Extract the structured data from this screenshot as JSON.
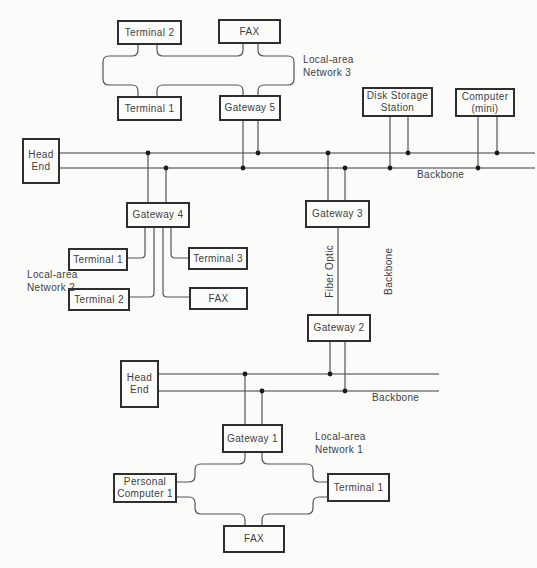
{
  "colors": {
    "background": "#fbfbf9",
    "box_border": "#2e2e30",
    "wire": "#55555a",
    "backbone_wire": "#7a7b7e",
    "junction_dot": "#1c1c1e",
    "text": "#3e3e41"
  },
  "nodes": {
    "terminal2_lan3": "Terminal 2",
    "fax_lan3": "FAX",
    "terminal1_lan3": "Terminal 1",
    "gateway5": "Gateway 5",
    "headend1": "Head\nEnd",
    "disk_storage": "Disk Storage\nStation",
    "computer_mini": "Computer\n(mini)",
    "gateway4": "Gateway 4",
    "terminal1_lan2": "Terminal 1",
    "terminal3_lan2": "Terminal 3",
    "terminal2_lan2": "Terminal 2",
    "fax_lan2": "FAX",
    "gateway3": "Gateway 3",
    "gateway2": "Gateway 2",
    "headend2": "Head\nEnd",
    "gateway1": "Gateway 1",
    "personal_computer1": "Personal\nComputer 1",
    "terminal1_lan1": "Terminal 1",
    "fax_lan1": "FAX"
  },
  "labels": {
    "lan3": "Local-area\nNetwork 3",
    "lan2": "Local-area\nNetwork 2",
    "lan1": "Local-area\nNetwork 1",
    "backbone_top": "Backbone",
    "backbone_bottom": "Backbone",
    "backbone_vertical": "Backbone",
    "fiber_optic": "Fiber Optic"
  }
}
